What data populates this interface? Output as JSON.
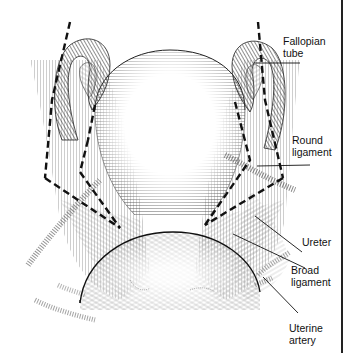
{
  "figure": {
    "type": "anatomical-illustration",
    "labels": [
      {
        "id": "fallopian-tube",
        "line1": "Fallopian",
        "line2": "tube"
      },
      {
        "id": "round-ligament",
        "line1": "Round",
        "line2": "ligament"
      },
      {
        "id": "ureter",
        "line1": "Ureter",
        "line2": ""
      },
      {
        "id": "broad-ligament",
        "line1": "Broad",
        "line2": "ligament"
      },
      {
        "id": "uterine-artery",
        "line1": "Uterine",
        "line2": "artery"
      }
    ]
  }
}
